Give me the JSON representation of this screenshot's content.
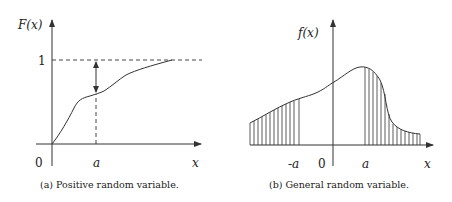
{
  "panel_a": {
    "ylabel": "F(x)",
    "xlabel": "x",
    "origin_label": "0",
    "tick_a_label": "a",
    "level_one_label": "1",
    "caption": "(a) Positive random variable."
  },
  "panel_b": {
    "ylabel": "f(x)",
    "xlabel": "x",
    "origin_label": "0",
    "tick_neg_a_label": "-a",
    "tick_a_label": "a",
    "caption": "(b) General random variable."
  }
}
